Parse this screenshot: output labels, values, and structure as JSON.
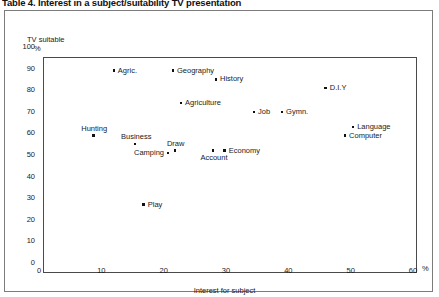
{
  "caption": "Table 4. Interest in a subject/suitability TV presentation",
  "chart_data": {
    "type": "scatter",
    "title": "Table 4. Interest in a subject/suitability TV presentation",
    "xlabel": "Interest for subject",
    "ylabel": "TV suitable",
    "x_unit": "%",
    "y_unit": "%",
    "xlim": [
      0,
      60
    ],
    "ylim": [
      0,
      100
    ],
    "xticks": [
      0,
      10,
      20,
      30,
      40,
      50,
      60
    ],
    "yticks": [
      0,
      10,
      20,
      30,
      40,
      50,
      60,
      70,
      80,
      90,
      100
    ],
    "grid": false,
    "legend": "none",
    "points": [
      {
        "label": "Agric.",
        "x": 12.0,
        "y": 89,
        "label_pos": "right"
      },
      {
        "label": "Geography",
        "x": 21.5,
        "y": 89,
        "label_pos": "right"
      },
      {
        "label": "History",
        "x": 28.4,
        "y": 85,
        "label_pos": "right"
      },
      {
        "label": "D.I.Y",
        "x": 46.0,
        "y": 81,
        "label_pos": "right"
      },
      {
        "label": "Agriculture",
        "x": 22.8,
        "y": 74,
        "label_pos": "right"
      },
      {
        "label": "Job",
        "x": 34.5,
        "y": 70,
        "label_pos": "right"
      },
      {
        "label": "Gymn.",
        "x": 39.0,
        "y": 70,
        "label_pos": "right"
      },
      {
        "label": "Language",
        "x": 50.4,
        "y": 63,
        "label_pos": "right"
      },
      {
        "label": "Computer",
        "x": 49.1,
        "y": 59,
        "label_pos": "right"
      },
      {
        "label": "Hunting",
        "x": 8.7,
        "y": 59,
        "label_pos": "above"
      },
      {
        "label": "Business",
        "x": 15.4,
        "y": 55,
        "label_pos": "above"
      },
      {
        "label": "Camping",
        "x": 20.7,
        "y": 51,
        "label_pos": "left"
      },
      {
        "label": "Draw",
        "x": 21.8,
        "y": 52,
        "label_pos": "above"
      },
      {
        "label": "Account",
        "x": 27.9,
        "y": 52,
        "label_pos": "below"
      },
      {
        "label": "Economy",
        "x": 29.8,
        "y": 52,
        "label_pos": "right"
      },
      {
        "label": "Play",
        "x": 16.8,
        "y": 27,
        "label_pos": "right"
      }
    ]
  }
}
